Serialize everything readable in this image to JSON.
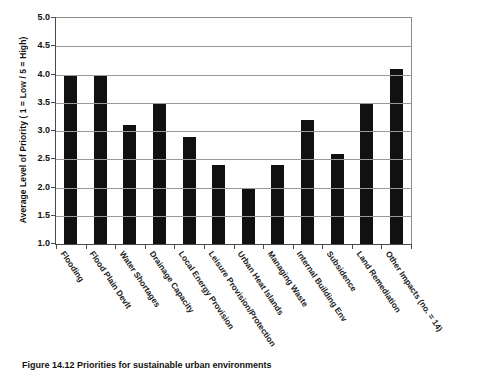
{
  "chart_data": {
    "type": "bar",
    "title": "",
    "xlabel": "",
    "ylabel": "Average Level of Priority ( 1 = Low / 5 = High)",
    "ylim": [
      1.0,
      5.0
    ],
    "ytick_labels": [
      "5.0",
      "4.5",
      "4.0",
      "3.5",
      "3.0",
      "2.5",
      "2.0",
      "1.5",
      "1.0"
    ],
    "ytick_values": [
      5.0,
      4.5,
      4.0,
      3.5,
      3.0,
      2.5,
      2.0,
      1.5,
      1.0
    ],
    "grid": true,
    "legend": "none",
    "bar_color": "#111111",
    "grid_color": "#9a9a9a",
    "axis_color": "#4a4a4a",
    "categories": [
      "Flooding",
      "Flood Plain Devlt",
      "Water Shortages",
      "Drainage Capacity",
      "Local Energy Provision",
      "Leisure Provision/Protection",
      "Urban Heat Islands",
      "Managing Waste",
      "Internal Building Env",
      "Subsidence",
      "Land Remediation",
      "Other Impacts (no. = 14)"
    ],
    "values": [
      4.0,
      4.0,
      3.1,
      3.5,
      2.9,
      2.4,
      2.0,
      2.4,
      3.2,
      2.6,
      3.5,
      4.1
    ]
  },
  "caption": {
    "text": "Figure 14.12   Priorities for sustainable urban environments"
  }
}
